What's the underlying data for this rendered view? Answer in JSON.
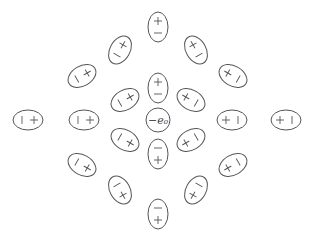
{
  "diagram": {
    "center_charge": {
      "label": "−e₀",
      "x": 158,
      "y": 120,
      "r": 12
    },
    "stroke_color": "#555555",
    "dipoles": [
      {
        "x": 158,
        "y": 27,
        "angle": 90,
        "near": "−",
        "far": "+"
      },
      {
        "x": 158,
        "y": 88,
        "angle": 90,
        "near": "−",
        "far": "+"
      },
      {
        "x": 158,
        "y": 154,
        "angle": 270,
        "near": "−",
        "far": "+"
      },
      {
        "x": 158,
        "y": 214,
        "angle": 270,
        "near": "−",
        "far": "+"
      },
      {
        "x": 28,
        "y": 120,
        "angle": 0,
        "near": "−",
        "far": "+"
      },
      {
        "x": 84,
        "y": 120,
        "angle": 0,
        "near": "−",
        "far": "+"
      },
      {
        "x": 232,
        "y": 120,
        "angle": 180,
        "near": "−",
        "far": "+"
      },
      {
        "x": 286,
        "y": 120,
        "angle": 180,
        "near": "−",
        "far": "+"
      },
      {
        "x": 120,
        "y": 50,
        "angle": 60,
        "near": "−",
        "far": "+"
      },
      {
        "x": 82,
        "y": 76,
        "angle": 30,
        "near": "−",
        "far": "+"
      },
      {
        "x": 125,
        "y": 100,
        "angle": 30,
        "near": "−",
        "far": "+"
      },
      {
        "x": 196,
        "y": 50,
        "angle": 120,
        "near": "−",
        "far": "+"
      },
      {
        "x": 233,
        "y": 76,
        "angle": 150,
        "near": "−",
        "far": "+"
      },
      {
        "x": 191,
        "y": 100,
        "angle": 150,
        "near": "−",
        "far": "+"
      },
      {
        "x": 125,
        "y": 140,
        "angle": -30,
        "near": "−",
        "far": "+"
      },
      {
        "x": 82,
        "y": 165,
        "angle": -30,
        "near": "−",
        "far": "+"
      },
      {
        "x": 120,
        "y": 190,
        "angle": -60,
        "near": "−",
        "far": "+"
      },
      {
        "x": 191,
        "y": 140,
        "angle": 210,
        "near": "−",
        "far": "+"
      },
      {
        "x": 233,
        "y": 165,
        "angle": 210,
        "near": "−",
        "far": "+"
      },
      {
        "x": 196,
        "y": 190,
        "angle": 240,
        "near": "−",
        "far": "+"
      }
    ]
  }
}
